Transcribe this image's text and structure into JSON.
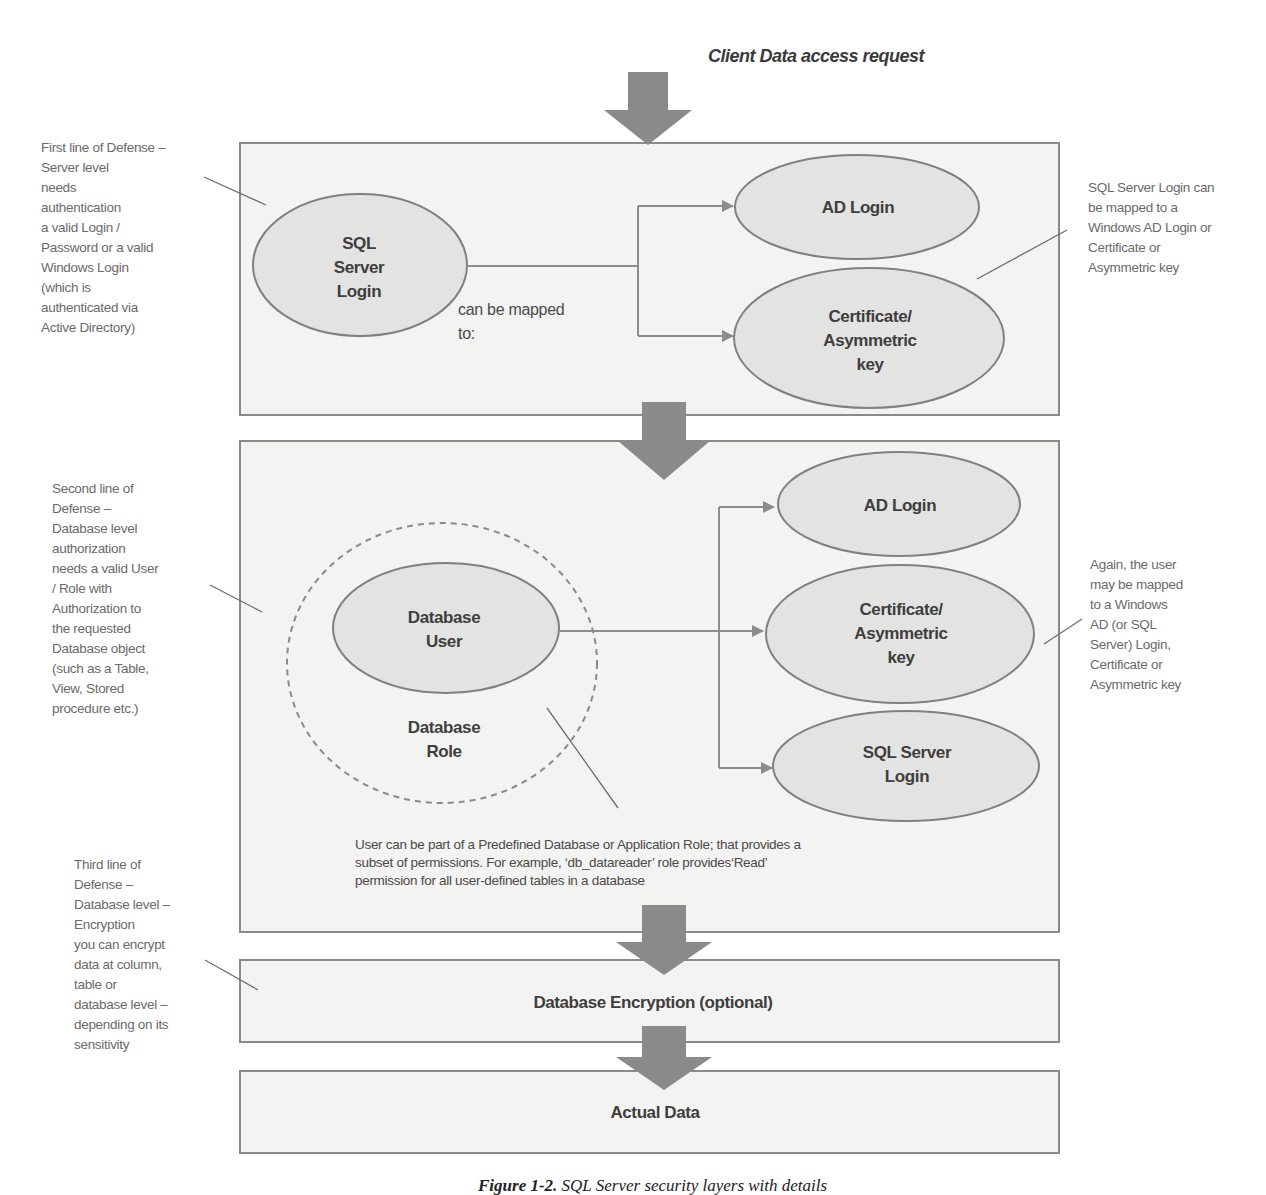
{
  "header": {
    "title": "Client Data access request"
  },
  "layers": {
    "server": {
      "source_node": "SQL\nServer\nLogin",
      "source_lines": [
        "SQL",
        "Server",
        "Login"
      ],
      "connector_label_lines": [
        "can be mapped",
        "to:"
      ],
      "targets": [
        {
          "lines": [
            "AD Login"
          ]
        },
        {
          "lines": [
            "Certificate/",
            "Asymmetric",
            "key"
          ]
        }
      ]
    },
    "database": {
      "source_lines": [
        "Database",
        "User"
      ],
      "group_label_lines": [
        "Database",
        "Role"
      ],
      "targets": [
        {
          "lines": [
            "AD Login"
          ]
        },
        {
          "lines": [
            "Certificate/",
            "Asymmetric",
            "key"
          ]
        },
        {
          "lines": [
            "SQL Server",
            "Login"
          ]
        }
      ],
      "role_note": "User can be part of a Predefined Database or Application Role; that provides a\nsubset of permissions. For example, ‘db_datareader’ role provides‘Read’\npermission for all user-defined tables in a database"
    },
    "encryption": {
      "label": "Database Encryption (optional)"
    },
    "data": {
      "label": "Actual Data"
    }
  },
  "annotations": {
    "left": [
      {
        "id": "first-line",
        "text": "First line of Defense –\nServer level\nneeds\nauthentication\na valid Login /\nPassword or a valid\nWindows Login\n(which is\nauthenticated via\nActive Directory)"
      },
      {
        "id": "second-line",
        "text": "Second line of\nDefense –\nDatabase level\nauthorization\nneeds a valid User\n/ Role with\nAuthorization to\nthe requested\nDatabase object\n(such as a Table,\nView, Stored\nprocedure etc.)"
      },
      {
        "id": "third-line",
        "text": "Third line of\nDefense –\nDatabase level –\nEncryption\nyou can encrypt\ndata at column,\ntable or\ndatabase level –\ndepending on its\nsensitivity"
      }
    ],
    "right": [
      {
        "id": "server-mapping",
        "text": "SQL Server Login can\nbe mapped to a\nWindows AD Login or\nCertificate or\nAsymmetric key"
      },
      {
        "id": "user-mapping",
        "text": "Again, the user\nmay be mapped\nto a Windows\nAD (or SQL\nServer) Login,\nCertificate or\nAsymmetric key"
      }
    ]
  },
  "caption": {
    "label": "Figure 1-2.",
    "text": "SQL Server security layers with details"
  },
  "colors": {
    "box_fill": "#f3f3f1",
    "ellipse_fill": "#e3e3e1",
    "stroke": "#8a8a8a",
    "arrow": "#8a8a8a",
    "note_text": "#6a6a6a",
    "node_text": "#3e3e3e"
  }
}
